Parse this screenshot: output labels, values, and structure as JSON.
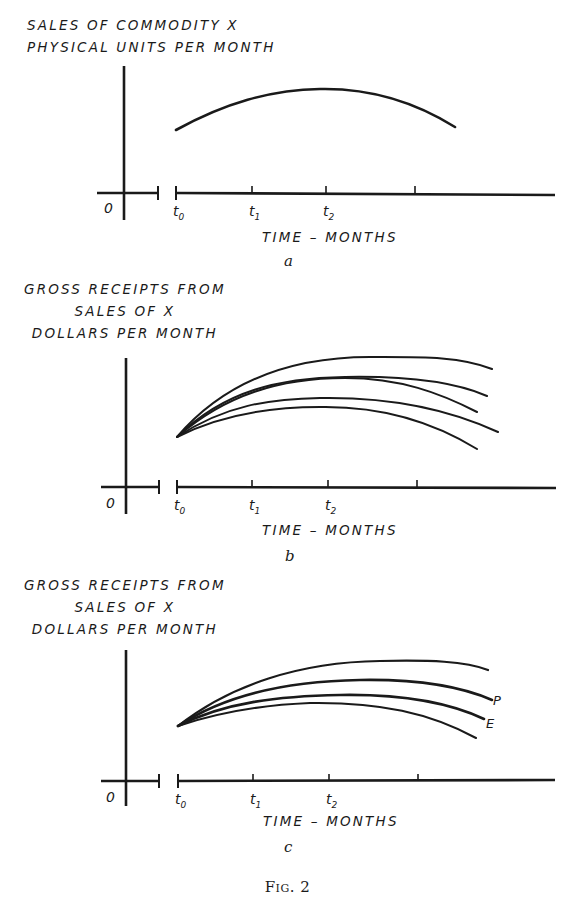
{
  "figure": {
    "caption": "Fig. 2",
    "ink_color": "#1a1a1a",
    "background": "#ffffff"
  },
  "panels": [
    {
      "id": "a",
      "letter": "a",
      "ylabel_lines": [
        "SALES OF COMMODITY X",
        "PHYSICAL UNITS PER MONTH"
      ],
      "xlabel": "TIME  –  MONTHS",
      "origin_label": "0",
      "ticks": [
        {
          "base": "t",
          "sub": "0",
          "x": 176
        },
        {
          "base": "t",
          "sub": "1",
          "x": 252
        },
        {
          "base": "t",
          "sub": "2",
          "x": 326
        },
        {
          "base": "",
          "sub": "",
          "x": 415
        }
      ],
      "curves": [
        {
          "path": "M176,130 C225,103 270,90 320,89 C370,88 415,102 455,127",
          "width": 2.6,
          "label": ""
        }
      ]
    },
    {
      "id": "b",
      "letter": "b",
      "ylabel_lines": [
        "GROSS RECEIPTS FROM",
        "SALES OF X",
        "DOLLARS PER MONTH"
      ],
      "xlabel": "TIME  –  MONTHS",
      "origin_label": "0",
      "ticks": [
        {
          "base": "t",
          "sub": "0",
          "x": 177
        },
        {
          "base": "t",
          "sub": "1",
          "x": 252
        },
        {
          "base": "t",
          "sub": "2",
          "x": 328
        },
        {
          "base": "",
          "sub": "",
          "x": 417
        }
      ],
      "curves": [
        {
          "path": "M177,437 C230,375 300,357 370,357 C420,357 460,356 492,369",
          "width": 2.0,
          "label": ""
        },
        {
          "path": "M177,437 C225,390 280,378 345,377 C400,376 450,380 487,396",
          "width": 2.0,
          "label": ""
        },
        {
          "path": "M177,437 C225,395 280,378 345,378 C400,378 440,393 477,412",
          "width": 2.0,
          "label": ""
        },
        {
          "path": "M177,437 C225,405 270,399 320,398 C380,397 440,405 498,432",
          "width": 2.0,
          "label": ""
        },
        {
          "path": "M177,437 C220,415 270,407 320,407 C380,406 430,420 477,449",
          "width": 2.0,
          "label": ""
        }
      ]
    },
    {
      "id": "c",
      "letter": "c",
      "ylabel_lines": [
        "GROSS RECEIPTS FROM",
        "SALES OF X",
        "DOLLARS PER MONTH"
      ],
      "xlabel": "TIME  –  MONTHS",
      "origin_label": "0",
      "ticks": [
        {
          "base": "t",
          "sub": "0",
          "x": 178
        },
        {
          "base": "t",
          "sub": "1",
          "x": 253
        },
        {
          "base": "t",
          "sub": "2",
          "x": 329
        },
        {
          "base": "",
          "sub": "",
          "x": 418
        }
      ],
      "curves": [
        {
          "path": "M178,726 C230,685 300,662 380,661 C430,660 465,661 488,670",
          "width": 2.2,
          "label": ""
        },
        {
          "path": "M178,726 C225,695 290,681 360,680 C420,679 460,686 492,700",
          "width": 2.6,
          "label": "P"
        },
        {
          "path": "M178,726 C225,702 280,696 340,695 C400,694 450,703 484,719",
          "width": 2.6,
          "label": "E"
        },
        {
          "path": "M178,726 C220,712 260,705 310,703 C380,702 430,713 476,738",
          "width": 2.0,
          "label": ""
        }
      ],
      "curve_labels": [
        {
          "text": "P",
          "x": 493,
          "y": 705
        },
        {
          "text": "E",
          "x": 486,
          "y": 728
        }
      ]
    }
  ]
}
